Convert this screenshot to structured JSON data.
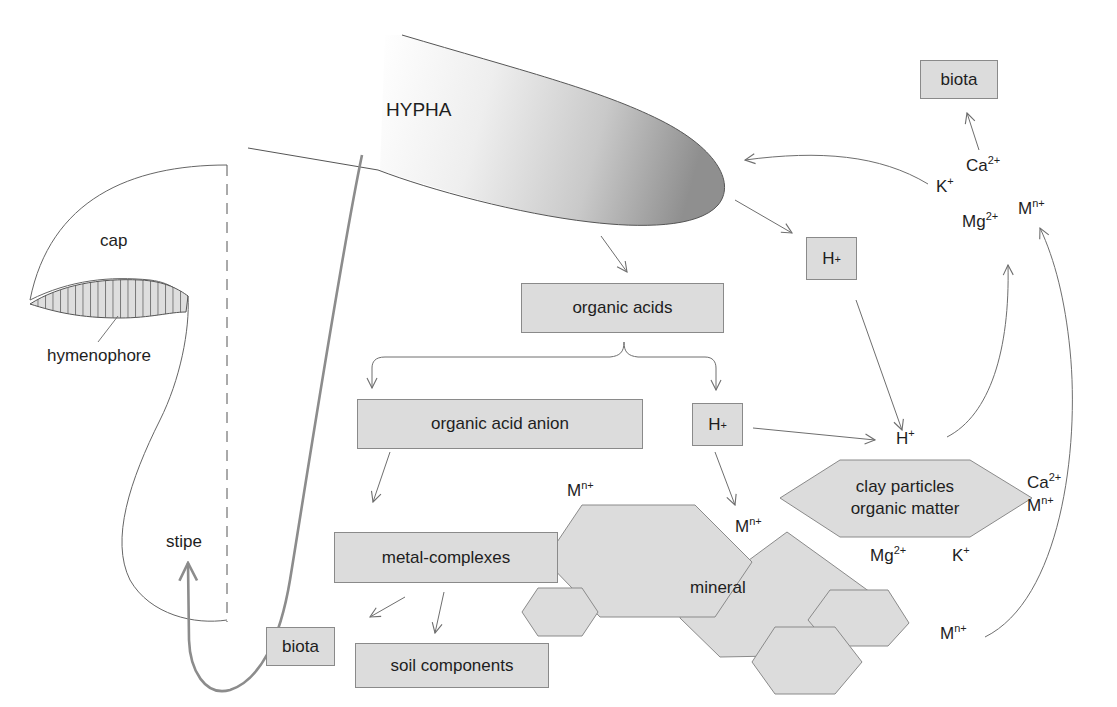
{
  "diagram": {
    "colors": {
      "box_fill": "#dcdcdc",
      "box_border": "#8a8a8a",
      "line": "#7a7a7a",
      "stipe_arrow": "#8c8c8c",
      "hypha_tip_dark": "#8f8f8f",
      "background": "#ffffff"
    },
    "mushroom": {
      "cap_label": "cap",
      "hymenophore_label": "hymenophore",
      "stipe_label": "stipe"
    },
    "hypha": {
      "label": "HYPHA"
    },
    "boxes": {
      "biota_top": "biota",
      "h_plus_upper": "H",
      "organic_acids": "organic acids",
      "organic_acid_anion": "organic acid anion",
      "h_plus_mid": "H",
      "metal_complexes": "metal-complexes",
      "biota_bottom": "biota",
      "soil_components": "soil components"
    },
    "charges": {
      "plus": "+",
      "two_plus": "2+",
      "n_plus": "n+"
    },
    "ions": {
      "top_right": [
        {
          "base": "Ca",
          "charge": "2+"
        },
        {
          "base": "K",
          "charge": "+"
        },
        {
          "base": "Mg",
          "charge": "2+"
        },
        {
          "base": "M",
          "charge": "n+"
        }
      ],
      "h_free": {
        "base": "H",
        "charge": "+"
      },
      "clay_right": [
        {
          "base": "Ca",
          "charge": "2+"
        },
        {
          "base": "M",
          "charge": "n+"
        }
      ],
      "clay_below": [
        {
          "base": "Mg",
          "charge": "2+"
        },
        {
          "base": "K",
          "charge": "+"
        }
      ],
      "mineral_left": {
        "base": "M",
        "charge": "n+"
      },
      "mineral_right": {
        "base": "M",
        "charge": "n+"
      },
      "bottom_right": {
        "base": "M",
        "charge": "n+"
      }
    },
    "clay": {
      "line1": "clay particles",
      "line2": "organic matter"
    },
    "mineral": {
      "label": "mineral"
    }
  }
}
